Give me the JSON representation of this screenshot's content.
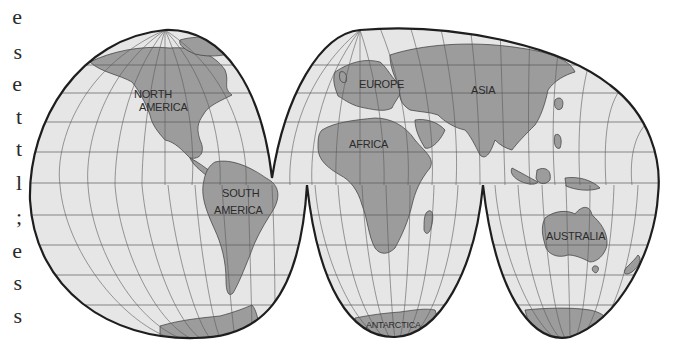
{
  "page": {
    "edge_text_fragments": [
      "e",
      "s",
      "e",
      "t",
      "t",
      "l",
      ";",
      "e",
      "s",
      "s"
    ]
  },
  "map": {
    "projection": "interrupted-homolosine",
    "labels": {
      "north_america_1": "NORTH",
      "north_america_2": "AMERICA",
      "south_america_1": "SOUTH",
      "south_america_2": "AMERICA",
      "europe": "EUROPE",
      "asia": "ASIA",
      "africa": "AFRICA",
      "australia": "AUSTRALIA",
      "antarctica": "ANTARCTICA"
    },
    "colors": {
      "ocean": "#e6e6e6",
      "land": "#9c9c9c",
      "outline": "#1e1e1e",
      "grid": "#5a5a5a",
      "text": "#2b2b2b"
    }
  }
}
